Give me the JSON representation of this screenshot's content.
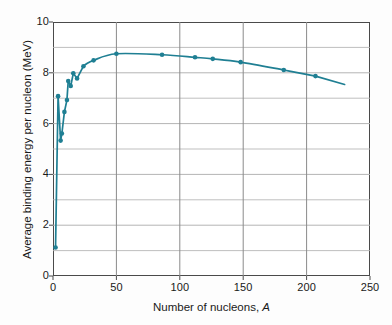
{
  "figure": {
    "name": "binding-energy-curve",
    "background_color": "#fdfdfd"
  },
  "chart_data": {
    "type": "line",
    "title": "",
    "xlabel": "Number of nucleons, A",
    "xlabel_plain": "Number of nucleons, ",
    "xlabel_italic": "A",
    "ylabel": "Average binding energy per nucleon (MeV)",
    "xlim": [
      0,
      250
    ],
    "ylim": [
      0,
      10
    ],
    "xticks": [
      0,
      50,
      100,
      150,
      200,
      250
    ],
    "yticks": [
      0,
      2,
      4,
      6,
      8,
      10
    ],
    "xtick_labels": [
      "0",
      "50",
      "100",
      "150",
      "200",
      "250"
    ],
    "ytick_labels": [
      "0",
      "2",
      "4",
      "6",
      "8",
      "10"
    ],
    "y_minor_step": 1,
    "x_minor_step": 50,
    "grid": true,
    "grid_color_horizontal": "#b4b4b4",
    "grid_color_vertical": "#8a8a8a",
    "legend": "none",
    "series": [
      {
        "name": "Average binding energy per nucleon",
        "color": "#1f7f93",
        "marker": "circle",
        "marker_size": 4.6,
        "line_width": 1.7,
        "x": [
          2,
          4,
          6,
          7,
          9,
          11,
          12,
          14,
          16,
          19,
          24,
          32,
          50,
          86,
          112,
          126,
          148,
          182,
          207
        ],
        "y": [
          1.12,
          7.08,
          5.33,
          5.61,
          6.46,
          6.93,
          7.68,
          7.48,
          7.98,
          7.78,
          8.26,
          8.49,
          8.75,
          8.71,
          8.61,
          8.55,
          8.42,
          8.11,
          7.87
        ],
        "tail_x": [
          207,
          230
        ],
        "tail_y": [
          7.87,
          7.54
        ]
      }
    ],
    "annotations": []
  },
  "axes": {
    "x_tick_label_0": "0",
    "x_tick_label_1": "50",
    "x_tick_label_2": "100",
    "x_tick_label_3": "150",
    "x_tick_label_4": "200",
    "x_tick_label_5": "250",
    "y_tick_label_0": "0",
    "y_tick_label_1": "2",
    "y_tick_label_2": "4",
    "y_tick_label_3": "6",
    "y_tick_label_4": "8",
    "y_tick_label_5": "10"
  }
}
